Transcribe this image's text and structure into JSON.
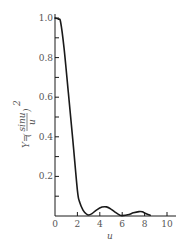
{
  "chart_data": {
    "type": "line",
    "title": "",
    "xlabel": "u",
    "ylabel": "Y=(sinu/u)²",
    "ylabel_parts": {
      "prefix": "Y=",
      "numerator": "sinu",
      "denominator": "u",
      "exponent": "2"
    },
    "xlim": [
      0,
      10.8
    ],
    "ylim": [
      0,
      1.0
    ],
    "x_ticks": [
      0,
      2,
      4,
      6,
      8,
      10
    ],
    "x_tick_labels": [
      "0",
      "2",
      "4",
      "6",
      "8",
      "10"
    ],
    "y_ticks": [
      0.1,
      0.2,
      0.3,
      0.4,
      0.5,
      0.6,
      0.7,
      0.8,
      0.9,
      1.0
    ],
    "y_tick_labels": [
      "",
      "0.2",
      "",
      "0.4",
      "",
      "0.6",
      "",
      "0.8",
      "",
      "1.0"
    ],
    "x_origin_label": "0",
    "grid": false,
    "legend": null,
    "series": [
      {
        "name": "Y=(sinu/u)²",
        "color": "#1a1a1a",
        "x": [
          0,
          0.3,
          0.5,
          0.8,
          1.2,
          1.6,
          2.0,
          2.2,
          2.5,
          2.8,
          3.0,
          3.3,
          3.7,
          4.2,
          4.6,
          5.0,
          5.4,
          5.8,
          6.0,
          6.5,
          7.0,
          7.5,
          7.8,
          8.1,
          8.5
        ],
        "y": [
          1.0,
          0.995,
          0.98,
          0.85,
          0.62,
          0.38,
          0.13,
          0.07,
          0.03,
          0.01,
          0.005,
          0.012,
          0.03,
          0.045,
          0.046,
          0.035,
          0.018,
          0.004,
          0.002,
          0.006,
          0.016,
          0.022,
          0.021,
          0.012,
          0.004
        ]
      }
    ]
  },
  "colors": {
    "axis": "#1a1a1a",
    "text": "#555555",
    "curve": "#1a1a1a",
    "background": "#ffffff"
  }
}
